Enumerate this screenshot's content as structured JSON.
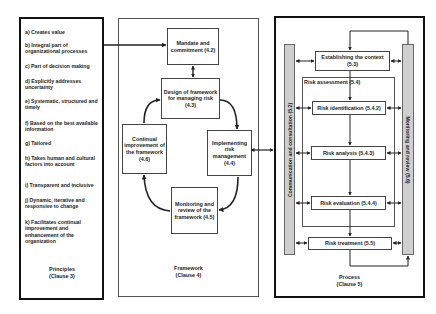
{
  "principles": {
    "items": [
      "a) Creates value",
      "b) Integral part of organizational processes",
      "c) Part of decision making",
      "d) Explicitly addresses uncertainty",
      "e) Systematic, structured and timely",
      "f) Based on the best available information",
      "g) Tailored",
      "h) Takes human and cultural factors into account",
      "i) Transparent and inclusive",
      "j) Dynamic, iterative and responsive to change",
      "k) Facilitates continual improvement and enhancement of the organization"
    ],
    "caption_line1": "Principles",
    "caption_line2": "(Clause 3)"
  },
  "framework": {
    "mandate": "Mandate and commitment (4.2)",
    "design": "Design of framework for managing risk (4.3)",
    "implementing": "Implementing risk management (4.4)",
    "monitoring": "Monitoring and review of the framework (4.5)",
    "continual": "Continual improvement of the framework (4.6)",
    "caption_line1": "Framework",
    "caption_line2": "(Clause 4)"
  },
  "process": {
    "communication": "Communication and consultation (5.2)",
    "monitoring_review": "Monitoring and review (5.6)",
    "establishing_line1": "Establishing the context",
    "establishing_line2": "(5.3)",
    "risk_assessment": "Risk  assessment (5.4)",
    "risk_identification": "Risk identification (5.4.2)",
    "risk_analysis": "Risk analysis (5.4.3)",
    "risk_evaluation": "Risk evaluation (5.4.4)",
    "risk_treatment": "Risk treatment (5.5)",
    "caption_line1": "Process",
    "caption_line2": "(Clause 5)"
  },
  "colors": {
    "border": "#111111",
    "bar_fill": "#cfcfcf",
    "line": "#222222"
  }
}
